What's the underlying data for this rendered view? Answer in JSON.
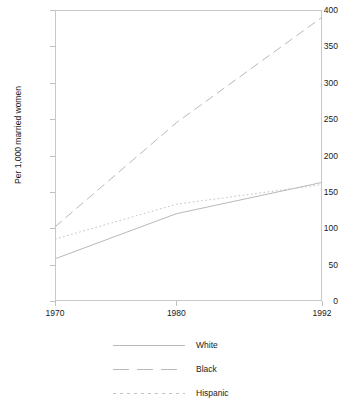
{
  "chart_data": {
    "type": "line",
    "title": "",
    "xlabel": "",
    "ylabel": "Per 1,000 married women",
    "xlim": [
      1970,
      1992
    ],
    "ylim": [
      0,
      400
    ],
    "grid": false,
    "legend_position": "below",
    "x_tick_labels": [
      "1970",
      "1980",
      "1992"
    ],
    "x_tick_values": [
      1970,
      1980,
      1992
    ],
    "y_tick_labels": [
      "0",
      "50",
      "100",
      "150",
      "200",
      "250",
      "300",
      "350",
      "400"
    ],
    "y_tick_values": [
      0,
      50,
      100,
      150,
      200,
      250,
      300,
      350,
      400
    ],
    "series": [
      {
        "name": "White",
        "style": "solid",
        "color": "#b9b9b9",
        "x": [
          1970,
          1980,
          1992
        ],
        "values": [
          58,
          120,
          163
        ]
      },
      {
        "name": "Black",
        "style": "dashed",
        "color": "#b9b9b9",
        "x": [
          1970,
          1980,
          1992
        ],
        "values": [
          102,
          245,
          390
        ]
      },
      {
        "name": "Hispanic",
        "style": "dotted",
        "color": "#c3c3c3",
        "x": [
          1970,
          1980,
          1992
        ],
        "values": [
          85,
          133,
          160
        ]
      }
    ]
  },
  "legend": {
    "entries": [
      {
        "label": "White"
      },
      {
        "label": "Black"
      },
      {
        "label": "Hispanic"
      }
    ]
  }
}
